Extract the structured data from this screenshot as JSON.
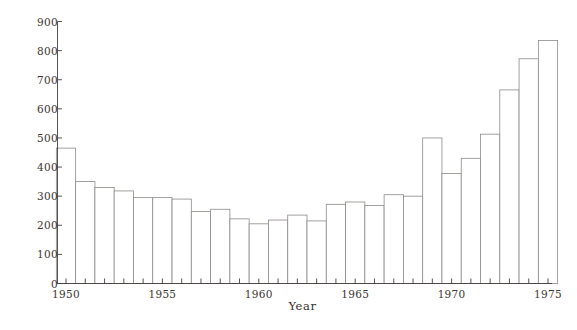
{
  "chart_data": {
    "type": "bar",
    "title": "",
    "subtitle": "",
    "xlabel": "Year",
    "ylabel": "Cases",
    "grid": false,
    "legend": null,
    "xlim": [
      1949.5,
      1975.5
    ],
    "ylim": [
      0,
      900
    ],
    "ytick_labels": [
      "0",
      "100",
      "200",
      "300",
      "400",
      "500",
      "600",
      "700",
      "800",
      "900"
    ],
    "ytick_values": [
      0,
      100,
      200,
      300,
      400,
      500,
      600,
      700,
      800,
      900
    ],
    "xtick_labels": [
      "1950",
      "1955",
      "1960",
      "1965",
      "1970",
      "1975"
    ],
    "xtick_values": [
      1950,
      1955,
      1960,
      1965,
      1970,
      1975
    ],
    "bar_style": {
      "fill": "#ffffff",
      "edge": "#8e8a86"
    },
    "categories": [
      1950,
      1951,
      1952,
      1953,
      1954,
      1955,
      1956,
      1957,
      1958,
      1959,
      1960,
      1961,
      1962,
      1963,
      1964,
      1965,
      1966,
      1967,
      1968,
      1969,
      1970,
      1971,
      1972,
      1973,
      1974,
      1975
    ],
    "values": [
      465,
      350,
      330,
      318,
      295,
      295,
      290,
      247,
      255,
      222,
      205,
      218,
      235,
      215,
      272,
      280,
      268,
      305,
      300,
      500,
      378,
      430,
      513,
      665,
      772,
      835
    ],
    "series": [
      {
        "name": "Cases",
        "values": [
          465,
          350,
          330,
          318,
          295,
          295,
          290,
          247,
          255,
          222,
          205,
          218,
          235,
          215,
          272,
          280,
          268,
          305,
          300,
          500,
          378,
          430,
          513,
          665,
          772,
          835
        ]
      }
    ]
  }
}
